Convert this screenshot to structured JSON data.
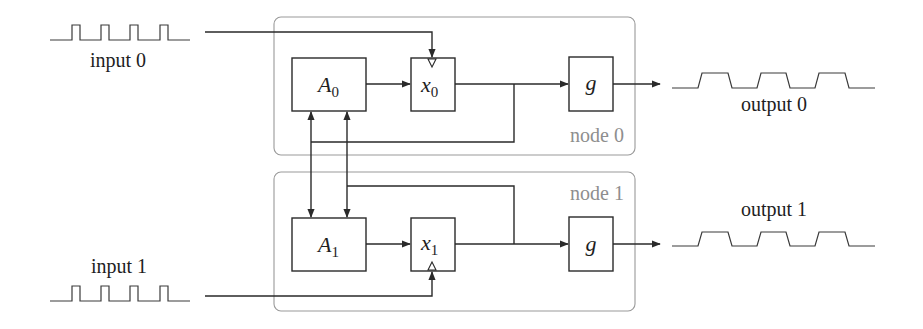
{
  "diagram": {
    "type": "block-diagram",
    "colors": {
      "line": "#2a2a2a",
      "node_frame": "#9a9a9a",
      "node_label": "#8e8e8e",
      "background": "#ffffff"
    },
    "inputs": [
      {
        "label": "input 0",
        "signal": "narrow-pulse-train",
        "pulses": 4
      },
      {
        "label": "input 1",
        "signal": "narrow-pulse-train",
        "pulses": 4
      }
    ],
    "outputs": [
      {
        "label": "output 0",
        "signal": "wide-pulse-train",
        "pulses": 3
      },
      {
        "label": "output 1",
        "signal": "wide-pulse-train",
        "pulses": 3
      }
    ],
    "nodes": [
      {
        "label": "node 0",
        "blocks": {
          "a": {
            "symbol": "A",
            "subscript": "0"
          },
          "x": {
            "symbol": "x",
            "subscript": "0"
          },
          "g": {
            "symbol": "g"
          }
        }
      },
      {
        "label": "node 1",
        "blocks": {
          "a": {
            "symbol": "A",
            "subscript": "1"
          },
          "x": {
            "symbol": "x",
            "subscript": "1"
          },
          "g": {
            "symbol": "g"
          }
        }
      }
    ],
    "connections": [
      {
        "from": "input 0",
        "to": "x0 (clock)"
      },
      {
        "from": "input 1",
        "to": "x1 (clock)"
      },
      {
        "from": "A0",
        "to": "x0"
      },
      {
        "from": "A1",
        "to": "x1"
      },
      {
        "from": "x0",
        "to": "g (node 0)"
      },
      {
        "from": "x1",
        "to": "g (node 1)"
      },
      {
        "from": "g (node 0)",
        "to": "output 0"
      },
      {
        "from": "g (node 1)",
        "to": "output 1"
      },
      {
        "from": "x0",
        "to": "A0 and A1"
      },
      {
        "from": "x1",
        "to": "A0 and A1"
      }
    ]
  }
}
